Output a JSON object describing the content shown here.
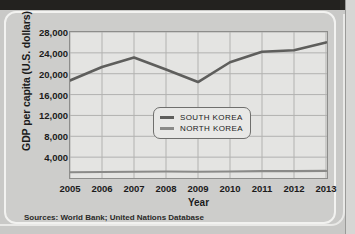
{
  "figure": {
    "source_note": "Sources: World Bank; United Nations Database"
  },
  "chart_data": {
    "type": "line",
    "title": "",
    "xlabel": "Year",
    "ylabel": "GDP per capita (U.S. dollars)",
    "categories": [
      "2005",
      "2006",
      "2007",
      "2008",
      "2009",
      "2010",
      "2011",
      "2012",
      "2013"
    ],
    "x": [
      2005,
      2006,
      2007,
      2008,
      2009,
      2010,
      2011,
      2012,
      2013
    ],
    "xlim": [
      2005,
      2013
    ],
    "ylim": [
      0,
      28000
    ],
    "yticks": [
      4000,
      8000,
      12000,
      16000,
      20000,
      24000,
      28000
    ],
    "ytick_labels": [
      "4,000",
      "8,000",
      "12,000",
      "16,000",
      "20,000",
      "24,000",
      "28,000"
    ],
    "grid": true,
    "legend_position": "inside-right",
    "series": [
      {
        "name": "SOUTH KOREA",
        "color": "#5e5e5c",
        "values": [
          18700,
          21300,
          23100,
          20800,
          18400,
          22200,
          24200,
          24500,
          26000
        ]
      },
      {
        "name": "NORTH KOREA",
        "color": "#8a8a88",
        "values": [
          1100,
          1150,
          1200,
          1250,
          1200,
          1250,
          1300,
          1300,
          1350
        ]
      }
    ]
  }
}
